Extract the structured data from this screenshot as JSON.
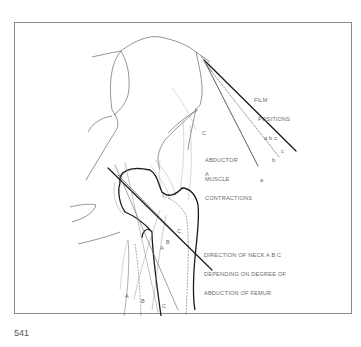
{
  "figure": {
    "number": "541",
    "labels": {
      "film_positions_line1": "FILM",
      "film_positions_line2": "POSITIONS",
      "film_positions_line3": "a b c",
      "abductor_line1": "ABDUCTOR",
      "abductor_line2": "MUSCLE",
      "abductor_line3": "CONTRACTIONS",
      "direction_line1": "DIRECTION OF NECK A B C",
      "direction_line2": "DEPENDING ON DEGREE OF",
      "direction_line3": "ABDUCTION OF FEMUR"
    },
    "markers": {
      "film_a": "a",
      "film_b": "b",
      "film_c": "c",
      "muscle_C": "C",
      "muscle_A": "A",
      "neck_A": "A",
      "neck_B": "B",
      "neck_C": "C",
      "shaft_A": "A",
      "shaft_B": "B",
      "shaft_C": "C"
    },
    "colors": {
      "outline": "#555555",
      "bold": "#1a1a1a",
      "light": "#a0a0a0",
      "text": "#6a6a6a"
    }
  }
}
